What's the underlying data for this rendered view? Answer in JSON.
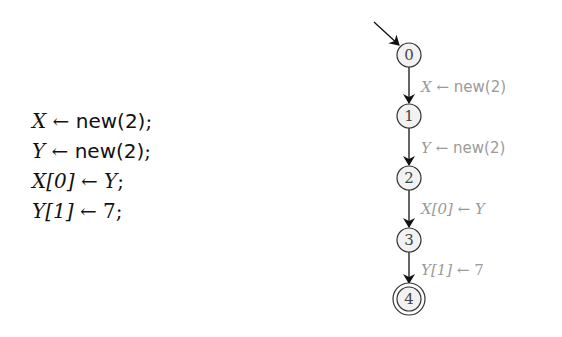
{
  "program": {
    "lines": [
      {
        "lhs": "X",
        "arrow": "←",
        "rhs": "new(2)",
        "end": ";"
      },
      {
        "lhs": "Y",
        "arrow": "←",
        "rhs": "new(2)",
        "end": ";"
      },
      {
        "lhs": "X[0]",
        "arrow": "←",
        "rhs": "Y",
        "end": ";"
      },
      {
        "lhs": "Y[1]",
        "arrow": "←",
        "rhs": "7",
        "end": ";"
      }
    ]
  },
  "automaton": {
    "states": [
      {
        "id": "0",
        "initial": true,
        "accepting": false
      },
      {
        "id": "1",
        "initial": false,
        "accepting": false
      },
      {
        "id": "2",
        "initial": false,
        "accepting": false
      },
      {
        "id": "3",
        "initial": false,
        "accepting": false
      },
      {
        "id": "4",
        "initial": false,
        "accepting": true
      }
    ],
    "transitions": [
      {
        "from": "0",
        "to": "1",
        "lhs": "X",
        "arrow": "←",
        "rhs": "new(2)"
      },
      {
        "from": "1",
        "to": "2",
        "lhs": "Y",
        "arrow": "←",
        "rhs": "new(2)"
      },
      {
        "from": "2",
        "to": "3",
        "lhs": "X[0]",
        "arrow": "←",
        "rhs": "Y"
      },
      {
        "from": "3",
        "to": "4",
        "lhs": "Y[1]",
        "arrow": "←",
        "rhs": "7"
      }
    ]
  },
  "colors": {
    "node_stroke": "#333333",
    "node_fill": "#f2f2f2",
    "edge": "#111111",
    "edge_label": "#9a9a9a",
    "code_text": "#111111"
  }
}
